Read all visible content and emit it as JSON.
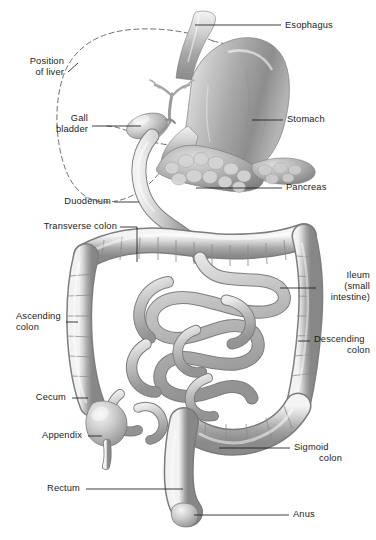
{
  "figure": {
    "background_color": "#ffffff",
    "ink_color": "#1b1b1b",
    "organ_fill_light": "#e8e8e8",
    "organ_fill_mid": "#bdbdbd",
    "organ_fill_dark": "#8e8e8e",
    "width": 376,
    "height": 540
  },
  "labels": {
    "esophagus": "Esophagus",
    "position_of_liver_line1": "Position",
    "position_of_liver_line2": "of liver",
    "stomach": "Stomach",
    "gall_bladder_line1": "Gall",
    "gall_bladder_line2": "bladder",
    "pancreas": "Pancreas",
    "duodenum": "Duodenum",
    "transverse_colon": "Transverse colon",
    "ileum_line1": "Ileum",
    "ileum_line2": "(small",
    "ileum_line3": "intestine)",
    "ascending_colon_line1": "Ascending",
    "ascending_colon_line2": "colon",
    "descending_colon_line1": "Descending",
    "descending_colon_line2": "colon",
    "cecum": "Cecum",
    "appendix": "Appendix",
    "sigmoid_colon_line1": "Sigmoid",
    "sigmoid_colon_line2": "colon",
    "rectum": "Rectum",
    "anus": "Anus"
  },
  "structures": [
    {
      "name": "esophagus",
      "type": "tube",
      "side": "right"
    },
    {
      "name": "stomach",
      "type": "organ",
      "side": "right"
    },
    {
      "name": "liver-outline",
      "type": "dashed",
      "side": "left"
    },
    {
      "name": "gall-bladder",
      "type": "organ",
      "side": "left"
    },
    {
      "name": "pancreas",
      "type": "organ",
      "side": "center"
    },
    {
      "name": "duodenum",
      "type": "tube",
      "side": "center"
    },
    {
      "name": "transverse-colon",
      "type": "haustra",
      "side": "center"
    },
    {
      "name": "ascending-colon",
      "type": "haustra",
      "side": "left"
    },
    {
      "name": "descending-colon",
      "type": "haustra",
      "side": "right"
    },
    {
      "name": "ileum",
      "type": "coil",
      "side": "center"
    },
    {
      "name": "cecum",
      "type": "organ",
      "side": "left"
    },
    {
      "name": "appendix",
      "type": "tube",
      "side": "left"
    },
    {
      "name": "sigmoid-colon",
      "type": "haustra",
      "side": "center"
    },
    {
      "name": "rectum",
      "type": "tube",
      "side": "center"
    },
    {
      "name": "anus",
      "type": "tube",
      "side": "center"
    }
  ]
}
